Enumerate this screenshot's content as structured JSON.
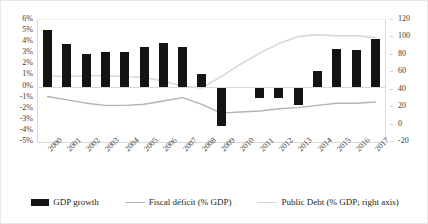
{
  "chart_data": {
    "type": "bar",
    "title": "",
    "subtitle": "",
    "xlabel": "",
    "ylabel": "",
    "ylabel_right": "",
    "grid": false,
    "legend_position": "bottom",
    "categories": [
      "2000",
      "2001",
      "2002",
      "2003",
      "2004",
      "2005",
      "2006",
      "2007",
      "2008",
      "2009",
      "2010",
      "2011",
      "2012",
      "2013",
      "2014",
      "2015",
      "2016",
      "2017"
    ],
    "ylim": [
      -5,
      6
    ],
    "ylim_right": [
      -20,
      120
    ],
    "yticks": [
      "6%",
      "5%",
      "4%",
      "3%",
      "2%",
      "1%",
      "0%",
      "-1%",
      "-2%",
      "-3%",
      "-4%",
      "-5%"
    ],
    "yticks_right": [
      "120",
      "100",
      "80",
      "60",
      "40",
      "20",
      "0",
      "-20"
    ],
    "series": [
      {
        "name": "GDP growth",
        "type": "bar",
        "axis": "left",
        "color": "#141414",
        "values": [
          5.1,
          3.8,
          2.9,
          3.1,
          3.1,
          3.6,
          3.9,
          3.6,
          1.1,
          -3.6,
          0.0,
          -1.0,
          -1.0,
          -1.7,
          1.4,
          3.4,
          3.3,
          4.3
        ]
      },
      {
        "name": "Fiscal déficit (% GDP)",
        "type": "line",
        "axis": "left",
        "color": "#b3b3b3",
        "values": [
          -0.9,
          -1.2,
          -1.5,
          -1.7,
          -1.7,
          -1.6,
          -1.3,
          -1.0,
          -1.6,
          -2.4,
          -2.3,
          -2.2,
          -2.0,
          -1.9,
          -1.7,
          -1.5,
          -1.5,
          -1.4
        ]
      },
      {
        "name": "Public Debt (% GDP; right axis)",
        "type": "line",
        "axis": "right",
        "color": "#d5d5d5",
        "values": [
          56,
          55,
          56,
          56,
          55,
          54,
          50,
          44,
          42,
          55,
          69,
          82,
          93,
          101,
          103,
          102,
          102,
          100
        ]
      }
    ]
  },
  "legend": {
    "items": [
      {
        "label": "GDP growth",
        "marker": "bar",
        "color": "#141414"
      },
      {
        "label": "Fiscal déficit (% GDP)",
        "marker": "line",
        "color": "#b3b3b3"
      },
      {
        "label": "Public Debt (% GDP; right axis)",
        "marker": "line-light",
        "color": "#d5d5d5"
      }
    ]
  }
}
